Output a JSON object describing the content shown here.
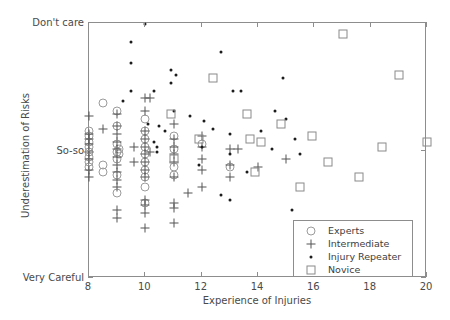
{
  "chart_data": {
    "type": "scatter",
    "title": "",
    "xlabel": "Experience of Injuries",
    "ylabel": "Underestimation of Risks",
    "xlim": [
      8,
      20
    ],
    "ylim": [
      0,
      10
    ],
    "grid": false,
    "xticks": [
      8,
      10,
      12,
      14,
      16,
      18,
      20
    ],
    "xticklabels": [
      "8",
      "10",
      "12",
      "14",
      "16",
      "18",
      "20"
    ],
    "yticks": [
      10,
      5,
      0
    ],
    "yticklabels": [
      "Don't care",
      "So-so",
      "Very Careful"
    ],
    "legend_position": "lower right",
    "series": [
      {
        "name": "Experts",
        "marker": "open-circle",
        "color": "#9b9b9b",
        "points": [
          [
            8.0,
            5.55
          ],
          [
            8.0,
            5.35
          ],
          [
            8.0,
            5.15
          ],
          [
            8.0,
            4.95
          ],
          [
            8.0,
            4.75
          ],
          [
            8.0,
            4.55
          ],
          [
            8.0,
            5.75
          ],
          [
            8.0,
            4.35
          ],
          [
            8.5,
            6.85
          ],
          [
            8.5,
            4.45
          ],
          [
            8.5,
            4.15
          ],
          [
            9.0,
            6.55
          ],
          [
            9.0,
            5.95
          ],
          [
            9.0,
            5.25
          ],
          [
            9.0,
            4.95
          ],
          [
            9.0,
            4.65
          ],
          [
            9.0,
            4.05
          ],
          [
            9.0,
            3.35
          ],
          [
            9.05,
            5.05
          ],
          [
            9.05,
            4.85
          ],
          [
            10.0,
            6.25
          ],
          [
            10.0,
            5.75
          ],
          [
            10.0,
            5.45
          ],
          [
            10.0,
            5.15
          ],
          [
            10.0,
            4.85
          ],
          [
            10.0,
            4.55
          ],
          [
            10.0,
            4.25
          ],
          [
            10.0,
            3.95
          ],
          [
            10.0,
            3.55
          ],
          [
            10.0,
            2.95
          ],
          [
            11.0,
            5.55
          ],
          [
            11.0,
            5.05
          ],
          [
            11.0,
            4.35
          ],
          [
            11.0,
            4.05
          ],
          [
            12.0,
            5.25
          ],
          [
            13.0,
            4.35
          ]
        ]
      },
      {
        "name": "Intermediate",
        "marker": "plus",
        "color": "#555555",
        "points": [
          [
            8.0,
            6.35
          ],
          [
            8.0,
            5.65
          ],
          [
            8.0,
            5.45
          ],
          [
            8.0,
            5.25
          ],
          [
            8.0,
            4.95
          ],
          [
            8.0,
            4.65
          ],
          [
            8.0,
            4.25
          ],
          [
            8.0,
            3.95
          ],
          [
            8.5,
            5.85
          ],
          [
            9.0,
            6.45
          ],
          [
            9.0,
            5.95
          ],
          [
            9.0,
            5.65
          ],
          [
            9.0,
            5.35
          ],
          [
            9.0,
            5.05
          ],
          [
            9.0,
            4.75
          ],
          [
            9.0,
            4.45
          ],
          [
            9.0,
            4.15
          ],
          [
            9.0,
            3.85
          ],
          [
            9.0,
            3.55
          ],
          [
            9.0,
            2.65
          ],
          [
            9.0,
            2.35
          ],
          [
            9.6,
            5.15
          ],
          [
            9.6,
            4.55
          ],
          [
            10.0,
            7.05
          ],
          [
            10.0,
            6.55
          ],
          [
            10.0,
            5.75
          ],
          [
            10.0,
            5.45
          ],
          [
            10.0,
            5.15
          ],
          [
            10.0,
            4.85
          ],
          [
            10.0,
            4.55
          ],
          [
            10.0,
            4.25
          ],
          [
            10.0,
            3.95
          ],
          [
            10.0,
            3.05
          ],
          [
            10.0,
            2.85
          ],
          [
            10.0,
            2.55
          ],
          [
            10.0,
            1.95
          ],
          [
            10.15,
            7.05
          ],
          [
            10.15,
            4.95
          ],
          [
            11.0,
            6.05
          ],
          [
            11.0,
            5.45
          ],
          [
            11.0,
            5.15
          ],
          [
            11.0,
            4.85
          ],
          [
            11.0,
            4.55
          ],
          [
            11.0,
            3.95
          ],
          [
            11.0,
            2.95
          ],
          [
            11.0,
            2.75
          ],
          [
            11.0,
            2.15
          ],
          [
            11.5,
            3.35
          ],
          [
            12.0,
            5.55
          ],
          [
            12.0,
            5.15
          ],
          [
            12.0,
            4.65
          ],
          [
            12.0,
            4.25
          ],
          [
            12.0,
            3.55
          ],
          [
            13.0,
            5.05
          ],
          [
            13.0,
            4.45
          ],
          [
            13.0,
            3.95
          ],
          [
            13.3,
            5.05
          ],
          [
            14.0,
            4.35
          ],
          [
            15.0,
            4.65
          ]
        ]
      },
      {
        "name": "Injury Repeater",
        "marker": "filled-dot",
        "color": "#1c1c1c",
        "points": [
          [
            10.0,
            9.95
          ],
          [
            9.5,
            9.25
          ],
          [
            9.5,
            8.45
          ],
          [
            10.9,
            8.15
          ],
          [
            11.1,
            7.95
          ],
          [
            10.9,
            7.65
          ],
          [
            12.7,
            8.85
          ],
          [
            9.5,
            7.35
          ],
          [
            10.3,
            7.35
          ],
          [
            13.1,
            7.35
          ],
          [
            13.4,
            7.35
          ],
          [
            14.9,
            7.85
          ],
          [
            9.2,
            6.95
          ],
          [
            11.0,
            6.55
          ],
          [
            11.6,
            6.35
          ],
          [
            12.1,
            6.15
          ],
          [
            14.6,
            6.55
          ],
          [
            15.0,
            6.25
          ],
          [
            10.1,
            6.05
          ],
          [
            10.5,
            5.95
          ],
          [
            10.7,
            5.75
          ],
          [
            12.4,
            5.85
          ],
          [
            13.0,
            5.65
          ],
          [
            14.1,
            5.75
          ],
          [
            15.3,
            5.45
          ],
          [
            10.3,
            5.35
          ],
          [
            10.4,
            5.15
          ],
          [
            10.4,
            4.95
          ],
          [
            12.0,
            5.15
          ],
          [
            13.0,
            4.85
          ],
          [
            14.5,
            5.05
          ],
          [
            15.5,
            4.85
          ],
          [
            11.9,
            4.45
          ],
          [
            13.6,
            4.15
          ],
          [
            12.7,
            3.25
          ],
          [
            15.2,
            2.65
          ],
          [
            13.0,
            3.05
          ]
        ]
      },
      {
        "name": "Novice",
        "marker": "open-square",
        "color": "#8a8a8a",
        "points": [
          [
            17.0,
            9.55
          ],
          [
            12.4,
            7.85
          ],
          [
            19.0,
            7.95
          ],
          [
            10.9,
            6.45
          ],
          [
            13.6,
            6.45
          ],
          [
            14.8,
            6.05
          ],
          [
            11.9,
            5.45
          ],
          [
            13.7,
            5.45
          ],
          [
            15.9,
            5.55
          ],
          [
            14.1,
            5.35
          ],
          [
            20.0,
            5.35
          ],
          [
            11.0,
            4.65
          ],
          [
            16.5,
            4.55
          ],
          [
            18.4,
            5.15
          ],
          [
            13.9,
            4.15
          ],
          [
            17.6,
            3.95
          ],
          [
            15.5,
            3.55
          ]
        ]
      }
    ]
  },
  "legend": {
    "items": [
      {
        "label": "Experts"
      },
      {
        "label": "Intermediate"
      },
      {
        "label": "Injury Repeater"
      },
      {
        "label": "Novice"
      }
    ]
  }
}
